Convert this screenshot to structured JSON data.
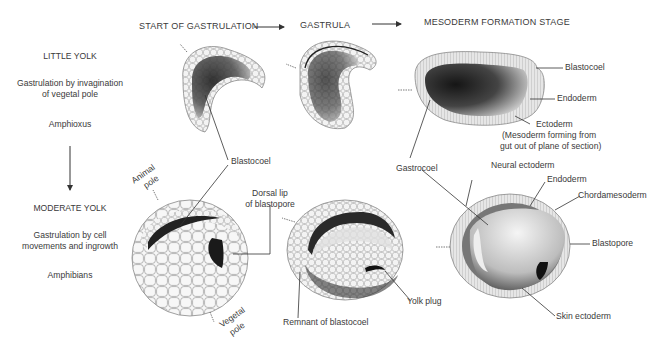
{
  "header": {
    "stages": [
      "START OF GASTRULATION",
      "GASTRULA",
      "MESODERM FORMATION STAGE"
    ]
  },
  "rows": [
    {
      "title": "LITTLE YOLK",
      "description_line1": "Gastrulation by invagination",
      "description_line2": "of vegetal pole",
      "organism": "Amphioxus"
    },
    {
      "title": "MODERATE YOLK",
      "description_line1": "Gastrulation by cell",
      "description_line2": "movements and ingrowth",
      "organism": "Amphibians"
    }
  ],
  "labels": {
    "blastocoel_top_right": "Blastocoel",
    "endoderm_top_right": "Endoderm",
    "ectoderm": "Ectoderm",
    "mesoderm_note_line1": "(Mesoderm forming from",
    "mesoderm_note_line2": "gut out of plane of section)",
    "blastocoel_center": "Blastocoel",
    "gastrocoel": "Gastrocoel",
    "neural_ectoderm": "Neural ectoderm",
    "endoderm_bottom": "Endoderm",
    "chordamesoderm": "Chordamesoderm",
    "blastopore": "Blastopore",
    "skin_ectoderm": "Skin ectoderm",
    "animal_pole_line1": "Animal",
    "animal_pole_line2": "pole",
    "vegetal_pole_line1": "Vegetal",
    "vegetal_pole_line2": "pole",
    "dorsal_lip_line1": "Dorsal lip",
    "dorsal_lip_line2": "of blastopore",
    "remnant_blastocoel": "Remnant of blastocoel",
    "yolk_plug": "Yolk plug"
  },
  "colors": {
    "ink": "#3a3a3a",
    "dark_fill": "#2a2a2a",
    "cell_fill": "#f2f2f2",
    "cell_stroke": "#9a9a9a"
  }
}
